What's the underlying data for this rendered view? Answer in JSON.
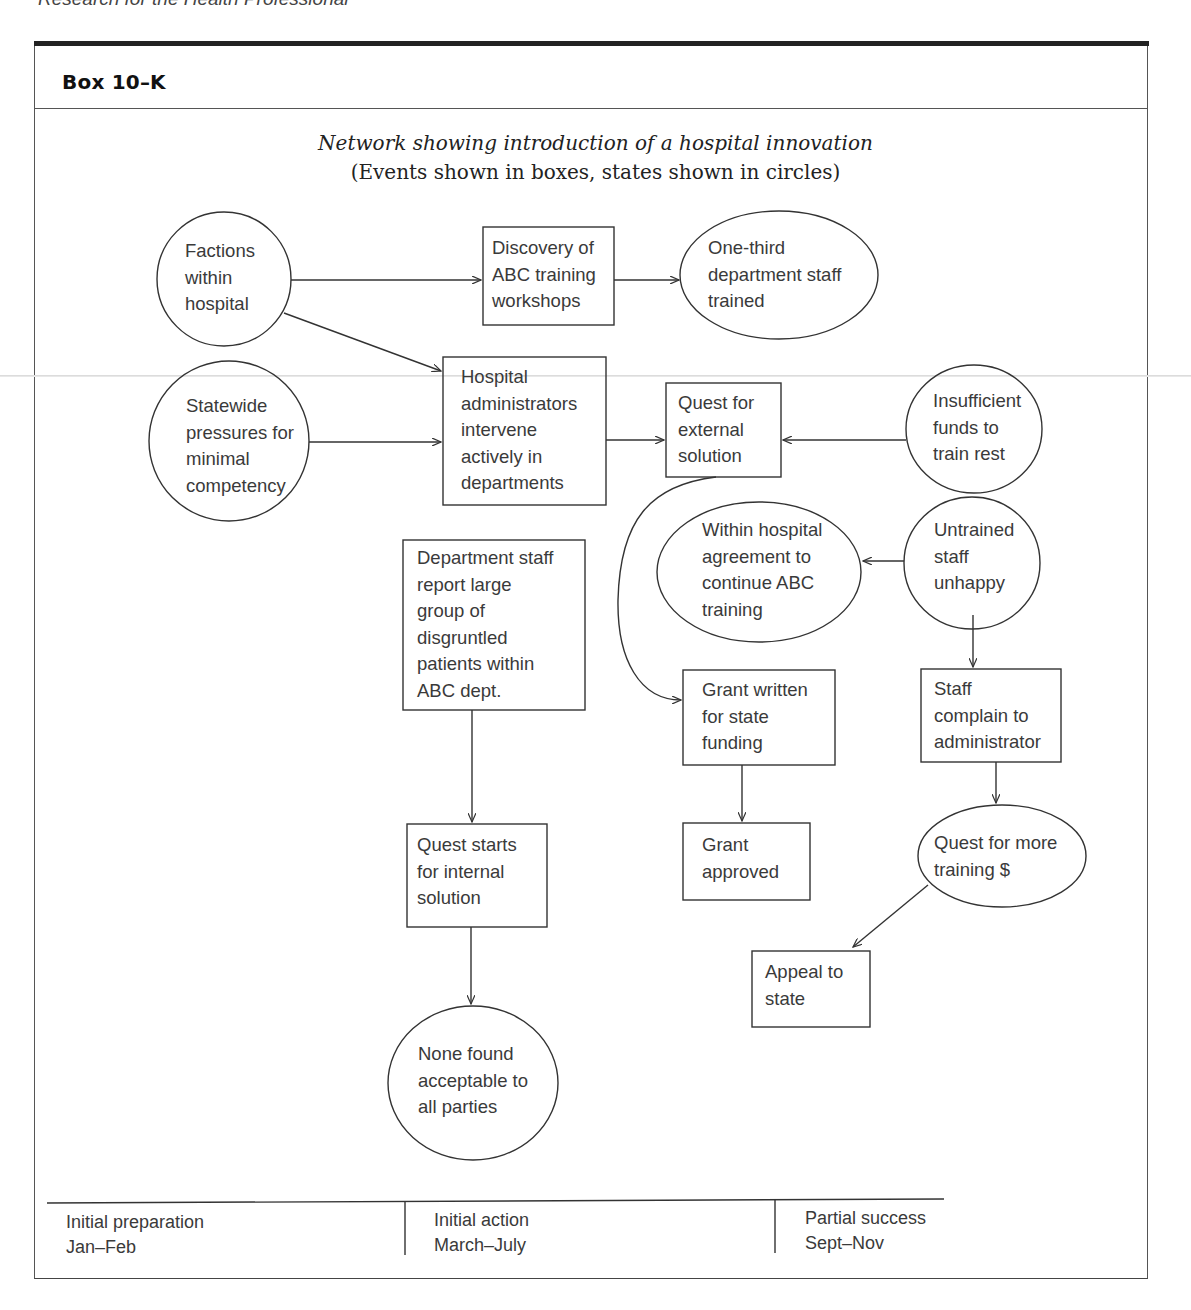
{
  "running_head": "Research for the Health Professional",
  "box": {
    "label": "Box 10–K",
    "title": "Network showing introduction of a hospital innovation",
    "subtitle": "(Events shown in boxes, states shown in circles)"
  },
  "nodes": {
    "factions": {
      "type": "state",
      "lines": [
        "Factions",
        "within",
        "hospital"
      ]
    },
    "discovery": {
      "type": "event",
      "lines": [
        "Discovery of",
        "ABC training",
        "workshops"
      ]
    },
    "one_third": {
      "type": "state",
      "lines": [
        "One-third",
        "department staff",
        "trained"
      ]
    },
    "statewide": {
      "type": "state",
      "lines": [
        "Statewide",
        "pressures for",
        "minimal",
        "competency"
      ]
    },
    "hospital_admin": {
      "type": "event",
      "lines": [
        "Hospital",
        "administrators",
        "intervene",
        "actively in",
        "departments"
      ]
    },
    "quest_external": {
      "type": "event",
      "lines": [
        "Quest for",
        "external",
        "solution"
      ]
    },
    "insufficient": {
      "type": "state",
      "lines": [
        "Insufficient",
        "funds to",
        "train rest"
      ]
    },
    "within_agreement": {
      "type": "state",
      "lines": [
        "Within hospital",
        "agreement to",
        "continue ABC",
        "training"
      ]
    },
    "untrained": {
      "type": "state",
      "lines": [
        "Untrained",
        "staff",
        "unhappy"
      ]
    },
    "dept_staff": {
      "type": "event",
      "lines": [
        "Department staff",
        "report large",
        "group of",
        "disgruntled",
        "patients within",
        "ABC dept."
      ]
    },
    "grant_written": {
      "type": "event",
      "lines": [
        "Grant written",
        "for state",
        "funding"
      ]
    },
    "staff_complain": {
      "type": "event",
      "lines": [
        "Staff",
        "complain to",
        "administrator"
      ]
    },
    "quest_internal": {
      "type": "event",
      "lines": [
        "Quest starts",
        "for internal",
        "solution"
      ]
    },
    "grant_approved": {
      "type": "event",
      "lines": [
        "Grant",
        "approved"
      ]
    },
    "quest_more": {
      "type": "state",
      "lines": [
        "Quest for more",
        "training $"
      ]
    },
    "appeal": {
      "type": "event",
      "lines": [
        "Appeal to",
        "state"
      ]
    },
    "none_found": {
      "type": "state",
      "lines": [
        "None found",
        "acceptable to",
        "all parties"
      ]
    }
  },
  "edges": [
    [
      "factions",
      "discovery"
    ],
    [
      "discovery",
      "one_third"
    ],
    [
      "factions",
      "hospital_admin"
    ],
    [
      "statewide",
      "hospital_admin"
    ],
    [
      "hospital_admin",
      "quest_external"
    ],
    [
      "insufficient",
      "quest_external"
    ],
    [
      "untrained",
      "within_agreement"
    ],
    [
      "quest_external",
      "grant_written"
    ],
    [
      "untrained",
      "staff_complain"
    ],
    [
      "dept_staff",
      "quest_internal"
    ],
    [
      "grant_written",
      "grant_approved"
    ],
    [
      "staff_complain",
      "quest_more"
    ],
    [
      "quest_more",
      "appeal"
    ],
    [
      "quest_internal",
      "none_found"
    ]
  ],
  "timeline": [
    {
      "phase": "Initial preparation",
      "period": "Jan–Feb"
    },
    {
      "phase": "Initial action",
      "period": "March–July"
    },
    {
      "phase": "Partial success",
      "period": "Sept–Nov"
    }
  ],
  "colors": {
    "stroke": "#333333",
    "text": "#3a3a3a",
    "frame_bar": "#222222"
  }
}
